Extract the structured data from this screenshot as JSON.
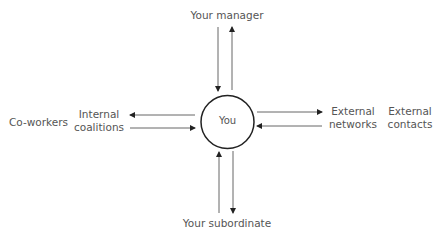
{
  "diagram": {
    "title": "",
    "center_node": {
      "label": "You"
    },
    "nodes": {
      "top": {
        "label": "Your manager"
      },
      "bottom": {
        "label": "Your subordinate"
      },
      "left_inner": {
        "line1": "Internal",
        "line2": "coalitions"
      },
      "left_outer": {
        "label": "Co-workers"
      },
      "right_inner": {
        "line1": "External",
        "line2": "networks"
      },
      "right_outer": {
        "line1": "External",
        "line2": "contacts"
      }
    },
    "edges": [
      {
        "from": "Your manager",
        "to": "You",
        "direction": "down"
      },
      {
        "from": "You",
        "to": "Your manager",
        "direction": "up"
      },
      {
        "from": "You",
        "to": "Internal coalitions",
        "direction": "left"
      },
      {
        "from": "Internal coalitions",
        "to": "You",
        "direction": "right"
      },
      {
        "from": "You",
        "to": "External networks",
        "direction": "right"
      },
      {
        "from": "External networks",
        "to": "You",
        "direction": "left"
      },
      {
        "from": "Your subordinate",
        "to": "You",
        "direction": "up"
      },
      {
        "from": "You",
        "to": "Your subordinate",
        "direction": "down"
      }
    ],
    "colors": {
      "line": "#333333",
      "circle": "#222222",
      "text": "#555555",
      "background": "#ffffff"
    }
  }
}
